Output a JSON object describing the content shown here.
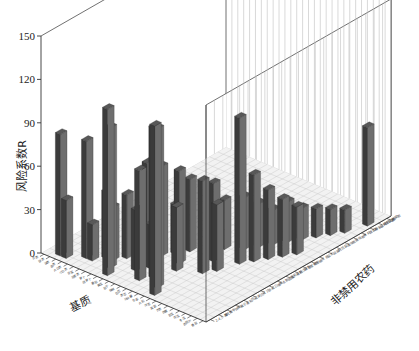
{
  "chart_data": {
    "type": "bar",
    "render": "3d-bar",
    "title": "",
    "subtitle": "",
    "xlabel": "基质",
    "ylabel": "非禁用农药",
    "zlabel": "风险系数R",
    "zlim": [
      0,
      150
    ],
    "z_ticks": [
      0,
      30,
      60,
      90,
      120,
      150
    ],
    "z_tick_labels": [
      "0",
      "30",
      "60",
      "90",
      "120",
      "150"
    ],
    "grid": true,
    "legend": null,
    "legend_position": "none",
    "bar_color": "#3b3b3b",
    "bar_side_color": "#6e6e6e",
    "bar_top_color": "#585858",
    "wall_color": "#ffffff",
    "gridline_color": "#b9b9b9",
    "floor_color": "#f2f2f2",
    "axis_color": "#333333",
    "n_x_categories": 28,
    "n_y_categories": 22,
    "x_categories": [
      "芹菜",
      "菠菜",
      "油菜",
      "韭菜",
      "大白菜",
      "小白菜",
      "甘蓝",
      "花椰菜",
      "萝卜",
      "胡萝卜",
      "番茄",
      "黄瓜",
      "茄子",
      "辣椒",
      "豇豆",
      "菜豆",
      "马铃薯",
      "生姜",
      "大蒜",
      "洋葱",
      "莴苣",
      "芥菜",
      "茼蒿",
      "苦瓜",
      "南瓜",
      "冬瓜",
      "西葫芦",
      "香菇"
    ],
    "y_categories": [
      "2,4,5-涕",
      "毒死蜱",
      "甲拌磷",
      "氧乐果",
      "克百威",
      "涕灭威",
      "灭多威",
      "三唑磷",
      "水胺硫磷",
      "氯氰菊酯",
      "氰戊菊酯",
      "联苯菊酯",
      "哒螨灵",
      "多菌灵",
      "腐霉利",
      "百菌清",
      "啶虫脒",
      "吡虫啉",
      "阿维菌素",
      "甲氨基阿维菌素",
      "烯酰吗啉",
      "嘧霉胺"
    ],
    "bars": [
      {
        "x": 2,
        "y": 1,
        "value": 84
      },
      {
        "x": 3,
        "y": 1,
        "value": 40
      },
      {
        "x": 5,
        "y": 2,
        "value": 81
      },
      {
        "x": 6,
        "y": 2,
        "value": 25
      },
      {
        "x": 7,
        "y": 3,
        "value": 46
      },
      {
        "x": 8,
        "y": 3,
        "value": 37
      },
      {
        "x": 9,
        "y": 4,
        "value": 44
      },
      {
        "x": 9,
        "y": 2,
        "value": 97
      },
      {
        "x": 10,
        "y": 5,
        "value": 27
      },
      {
        "x": 10,
        "y": 1,
        "value": 115
      },
      {
        "x": 11,
        "y": 5,
        "value": 66
      },
      {
        "x": 12,
        "y": 6,
        "value": 62
      },
      {
        "x": 12,
        "y": 3,
        "value": 42
      },
      {
        "x": 13,
        "y": 7,
        "value": 34
      },
      {
        "x": 13,
        "y": 4,
        "value": 30
      },
      {
        "x": 14,
        "y": 8,
        "value": 50
      },
      {
        "x": 14,
        "y": 2,
        "value": 76
      },
      {
        "x": 15,
        "y": 6,
        "value": 64
      },
      {
        "x": 15,
        "y": 3,
        "value": 104
      },
      {
        "x": 16,
        "y": 9,
        "value": 26
      },
      {
        "x": 16,
        "y": 5,
        "value": 44
      },
      {
        "x": 17,
        "y": 10,
        "value": 34
      },
      {
        "x": 17,
        "y": 2,
        "value": 110
      },
      {
        "x": 18,
        "y": 8,
        "value": 54
      },
      {
        "x": 18,
        "y": 1,
        "value": 117
      },
      {
        "x": 19,
        "y": 11,
        "value": 36
      },
      {
        "x": 19,
        "y": 6,
        "value": 64
      },
      {
        "x": 20,
        "y": 12,
        "value": 30
      },
      {
        "x": 20,
        "y": 7,
        "value": 46
      },
      {
        "x": 21,
        "y": 13,
        "value": 24
      },
      {
        "x": 21,
        "y": 9,
        "value": 101
      },
      {
        "x": 22,
        "y": 14,
        "value": 28
      },
      {
        "x": 22,
        "y": 10,
        "value": 60
      },
      {
        "x": 23,
        "y": 15,
        "value": 22
      },
      {
        "x": 23,
        "y": 11,
        "value": 48
      },
      {
        "x": 24,
        "y": 16,
        "value": 20
      },
      {
        "x": 24,
        "y": 12,
        "value": 40
      },
      {
        "x": 25,
        "y": 17,
        "value": 18
      },
      {
        "x": 25,
        "y": 13,
        "value": 33
      },
      {
        "x": 26,
        "y": 18,
        "value": 16
      },
      {
        "x": 27,
        "y": 20,
        "value": 68
      }
    ],
    "value_range": [
      16,
      117
    ],
    "bar_count": 41
  },
  "axes": {
    "z_title": "风险系数R",
    "x_title": "基质",
    "y_title": "非禁用农药"
  }
}
